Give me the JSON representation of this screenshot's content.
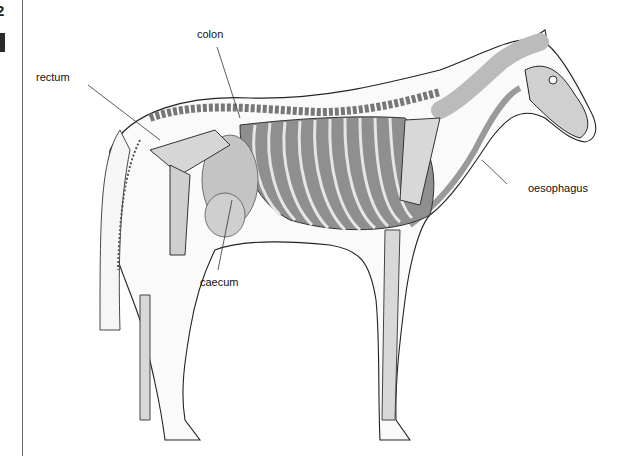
{
  "page": {
    "number_fragment": "2",
    "section_marker": "dark-block"
  },
  "diagram": {
    "colors": {
      "outline": "#222222",
      "bone": "#d8d8d8",
      "organ": "#c4c4c4",
      "rib_shadow": "#8a8a8a",
      "oesophagus": "#9a9a9a",
      "background": "#ffffff"
    },
    "labels": [
      {
        "id": "colon",
        "text": "colon"
      },
      {
        "id": "rectum",
        "text": "rectum"
      },
      {
        "id": "caecum",
        "text": "caecum"
      },
      {
        "id": "oesophagus",
        "text": "oesophagus"
      }
    ]
  }
}
